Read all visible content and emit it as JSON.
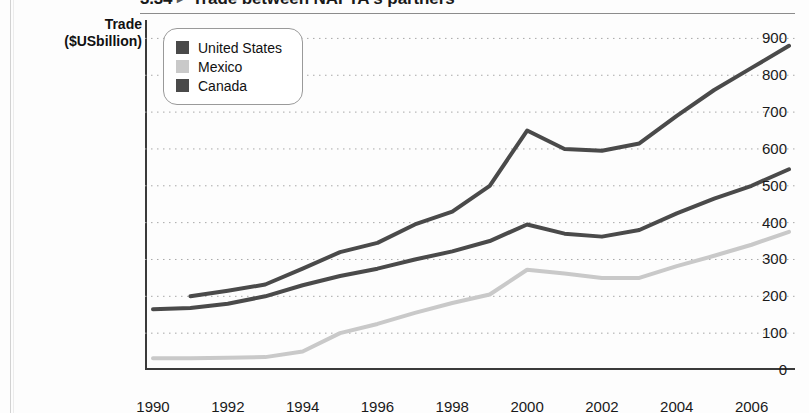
{
  "figure": {
    "number": "3.34",
    "marker_icon": "triangle-right-icon",
    "title": "Trade between NAFTA's partners"
  },
  "axis_title": {
    "line1": "Trade",
    "line2": "($USbillion)"
  },
  "legend": {
    "items": [
      {
        "label": "United States",
        "color": "#4a4a4a",
        "icon": "legend-swatch-united-states"
      },
      {
        "label": "Mexico",
        "color": "#c9c9c9",
        "icon": "legend-swatch-mexico"
      },
      {
        "label": "Canada",
        "color": "#4a4a4a",
        "icon": "legend-swatch-canada"
      }
    ]
  },
  "chart_data": {
    "type": "line",
    "title": "Trade between NAFTA's partners",
    "xlabel": "",
    "ylabel": "Trade ($USbillion)",
    "xlim": [
      1990,
      2007
    ],
    "ylim": [
      0,
      950
    ],
    "grid": true,
    "grid_axis": "y",
    "legend_position": "top-left",
    "x": [
      1990,
      1991,
      1992,
      1993,
      1994,
      1995,
      1996,
      1997,
      1998,
      1999,
      2000,
      2001,
      2002,
      2003,
      2004,
      2005,
      2006,
      2007
    ],
    "xticks": [
      1990,
      1991,
      1992,
      1993,
      1994,
      1995,
      1996,
      1997,
      1998,
      1999,
      2000,
      2001,
      2002,
      2003,
      2004,
      2005,
      2006,
      2007
    ],
    "xtick_labels": [
      "1990",
      "",
      "1992",
      "",
      "1994",
      "",
      "1996",
      "",
      "1998",
      "",
      "2000",
      "",
      "2002",
      "",
      "2004",
      "",
      "2006",
      ""
    ],
    "yticks": [
      0,
      100,
      200,
      300,
      400,
      500,
      600,
      700,
      800,
      900
    ],
    "ytick_labels": [
      "0",
      "100",
      "200",
      "300",
      "400",
      "500",
      "600",
      "700",
      "800",
      "900"
    ],
    "series": [
      {
        "name": "United States",
        "color": "#4a4a4a",
        "values": [
          null,
          200,
          215,
          232,
          275,
          320,
          345,
          395,
          430,
          500,
          650,
          600,
          595,
          615,
          690,
          760,
          820,
          880
        ]
      },
      {
        "name": "Canada",
        "color": "#4a4a4a",
        "values": [
          165,
          168,
          180,
          200,
          230,
          255,
          275,
          300,
          322,
          350,
          395,
          370,
          362,
          380,
          425,
          465,
          500,
          545
        ]
      },
      {
        "name": "Mexico",
        "color": "#c9c9c9",
        "values": [
          32,
          32,
          33,
          35,
          50,
          100,
          125,
          155,
          182,
          205,
          272,
          262,
          250,
          250,
          282,
          310,
          340,
          375
        ]
      }
    ]
  }
}
